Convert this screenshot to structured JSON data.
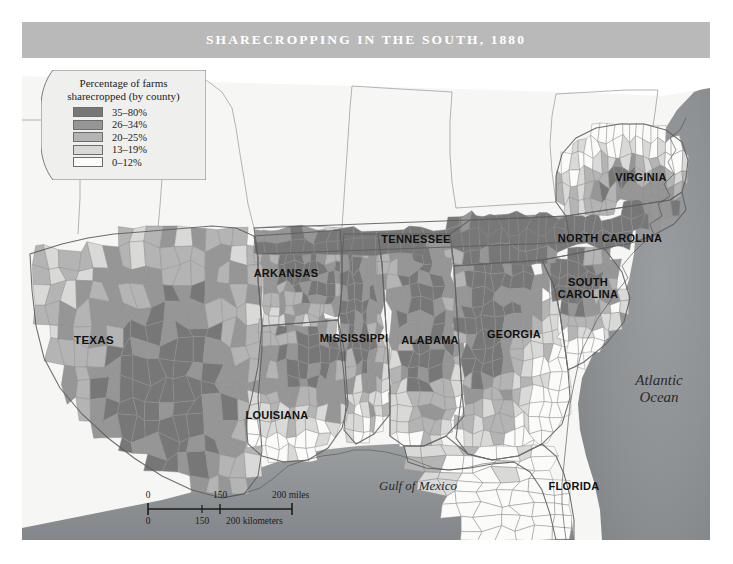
{
  "title": "SHARECROPPING IN THE SOUTH, 1880",
  "legend": {
    "title_line1": "Percentage of farms",
    "title_line2": "sharecropped (by county)",
    "classes": [
      {
        "label": "35–80%",
        "color": "#777777"
      },
      {
        "label": "26–34%",
        "color": "#969696"
      },
      {
        "label": "20–25%",
        "color": "#b4b4b4"
      },
      {
        "label": "13–19%",
        "color": "#d9d9d7"
      },
      {
        "label": "0–12%",
        "color": "#fbfbfa"
      }
    ]
  },
  "state_labels": [
    {
      "name": "texas",
      "text": "TEXAS",
      "x": 72,
      "y": 282,
      "size": 11.5
    },
    {
      "name": "louisiana",
      "text": "LOUISIANA",
      "x": 255,
      "y": 358,
      "size": 11
    },
    {
      "name": "arkansas",
      "text": "ARKANSAS",
      "x": 264,
      "y": 216,
      "size": 11
    },
    {
      "name": "mississippi",
      "text": "MISSISSIPPI",
      "x": 332,
      "y": 281,
      "size": 11
    },
    {
      "name": "alabama",
      "text": "ALABAMA",
      "x": 408,
      "y": 283,
      "size": 11
    },
    {
      "name": "tennessee",
      "text": "TENNESSEE",
      "x": 394,
      "y": 182,
      "size": 11
    },
    {
      "name": "georgia",
      "text": "GEORGIA",
      "x": 492,
      "y": 277,
      "size": 11
    },
    {
      "name": "florida",
      "text": "FLORIDA",
      "x": 552,
      "y": 429,
      "size": 11
    },
    {
      "name": "south-carolina",
      "text": "SOUTH\nCAROLINA",
      "x": 566,
      "y": 231,
      "size": 11
    },
    {
      "name": "north-carolina",
      "text": "NORTH CAROLINA",
      "x": 588,
      "y": 181,
      "size": 11
    },
    {
      "name": "virginia",
      "text": "VIRGINIA",
      "x": 619,
      "y": 120,
      "size": 11
    }
  ],
  "water_labels": [
    {
      "name": "gulf-of-mexico",
      "text": "Gulf of Mexico",
      "x": 396,
      "y": 428,
      "size": 13
    },
    {
      "name": "atlantic-ocean",
      "text": "Atlantic\nOcean",
      "x": 637,
      "y": 331,
      "size": 15
    }
  ],
  "scalebar": {
    "miles_unit": "200 miles",
    "km_unit": "200 kilometers",
    "miles_ticks": [
      "0",
      "150"
    ],
    "km_ticks": [
      "0",
      "150"
    ]
  },
  "colors": {
    "title_band": "#b9b9b9",
    "map_background": "#f3f3f1",
    "ocean": "#8e9193",
    "land_outside": "#f7f7f5",
    "border": "#8a8a8a"
  }
}
